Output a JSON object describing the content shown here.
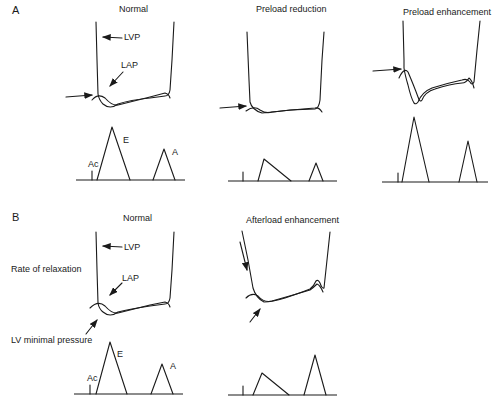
{
  "panels": {
    "A": {
      "letter": "A",
      "columns": [
        {
          "title": "Normal",
          "labels": {
            "lvp": "LVP",
            "lap": "LAP",
            "e": "E",
            "a": "A",
            "ac": "Ac"
          }
        },
        {
          "title": "Preload reduction"
        },
        {
          "title": "Preload enhancement"
        }
      ]
    },
    "B": {
      "letter": "B",
      "side_labels": {
        "relaxation": "Rate of relaxation",
        "lv_min": "LV minimal pressure"
      },
      "columns": [
        {
          "title": "Normal",
          "labels": {
            "lvp": "LVP",
            "lap": "LAP",
            "e": "E",
            "a": "A",
            "ac": "Ac"
          }
        },
        {
          "title": "Afterload enhancement"
        }
      ]
    }
  }
}
